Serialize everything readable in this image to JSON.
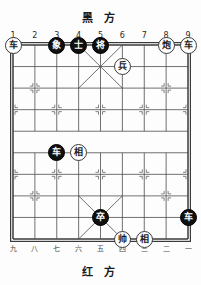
{
  "titles": {
    "black_side": "黑 方",
    "red_side": "红 方"
  },
  "coordinates": {
    "top": [
      "1",
      "2",
      "3",
      "4",
      "5",
      "6",
      "7",
      "8",
      "9"
    ],
    "bottom": [
      "九",
      "八",
      "七",
      "六",
      "五",
      "四",
      "三",
      "二",
      "一"
    ]
  },
  "board": {
    "files": 9,
    "ranks": 10,
    "colors": {
      "line": "#4d4d4d",
      "frame": "#3a3a3a",
      "red_piece_bg": "#ffffff",
      "red_piece_fg": "#1d1d1d",
      "black_piece_bg": "#101010",
      "black_piece_fg": "#ffffff"
    }
  },
  "pieces": [
    {
      "label": "车",
      "side": "red",
      "file": 1,
      "rank": 0,
      "name": "red-chariot-file1"
    },
    {
      "label": "象",
      "side": "black",
      "file": 3,
      "rank": 0,
      "name": "black-elephant-file3"
    },
    {
      "label": "士",
      "side": "black",
      "file": 4,
      "rank": 0,
      "name": "black-advisor-file4"
    },
    {
      "label": "将",
      "side": "black",
      "file": 5,
      "rank": 0,
      "name": "black-general-file5"
    },
    {
      "label": "炮",
      "side": "red",
      "file": 8,
      "rank": 0,
      "name": "red-cannon-file8"
    },
    {
      "label": "车",
      "side": "red",
      "file": 9,
      "rank": 0,
      "name": "red-chariot-file9"
    },
    {
      "label": "兵",
      "side": "red",
      "file": 6,
      "rank": 1,
      "name": "red-pawn-file6"
    },
    {
      "label": "车",
      "side": "black",
      "file": 3,
      "rank": 5,
      "name": "black-chariot-file3"
    },
    {
      "label": "相",
      "side": "red",
      "file": 4,
      "rank": 5,
      "name": "red-elephant-file4"
    },
    {
      "label": "卒",
      "side": "black",
      "file": 5,
      "rank": 8,
      "name": "black-pawn-file5"
    },
    {
      "label": "车",
      "side": "black",
      "file": 9,
      "rank": 8,
      "name": "black-chariot-file9"
    },
    {
      "label": "帅",
      "side": "red",
      "file": 6,
      "rank": 9,
      "name": "red-general-file6"
    },
    {
      "label": "相",
      "side": "red",
      "file": 7,
      "rank": 9,
      "name": "red-elephant-file7"
    }
  ]
}
